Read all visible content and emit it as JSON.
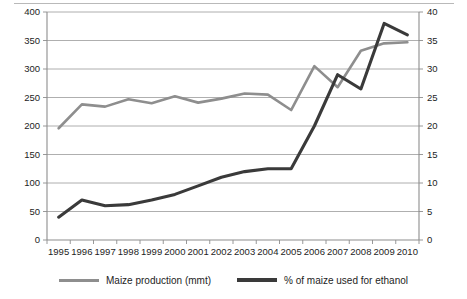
{
  "chart_data": {
    "type": "line",
    "title": "",
    "xlabel": "",
    "grid": true,
    "legend_position": "bottom",
    "x": [
      1995,
      1996,
      1997,
      1998,
      1999,
      2000,
      2001,
      2002,
      2003,
      2004,
      2005,
      2006,
      2007,
      2008,
      2009,
      2010
    ],
    "categories": [
      "1995",
      "1996",
      "1997",
      "1998",
      "1999",
      "2000",
      "2001",
      "2002",
      "2003",
      "2004",
      "2005",
      "2006",
      "2007",
      "2008",
      "2009",
      "2010"
    ],
    "axes": {
      "left": {
        "label": "Maize production (mmt)",
        "ylim": [
          0,
          400
        ],
        "ticks": [
          0,
          50,
          100,
          150,
          200,
          250,
          300,
          350,
          400
        ],
        "ticklabels": [
          "0",
          "50",
          "100",
          "150",
          "200",
          "250",
          "300",
          "350",
          "400"
        ]
      },
      "right": {
        "label": "% of maize used for ethanol",
        "ylim": [
          0,
          40
        ],
        "ticks": [
          0,
          5,
          10,
          15,
          20,
          25,
          30,
          35,
          40
        ],
        "ticklabels": [
          "0",
          "5",
          "10",
          "15",
          "20",
          "25",
          "30",
          "35",
          "40"
        ]
      }
    },
    "series": [
      {
        "name": "Maize production (mmt)",
        "axis": "left",
        "color": "#8e8e8e",
        "values": [
          196,
          238,
          234,
          247,
          240,
          252,
          241,
          248,
          257,
          255,
          228,
          305,
          268,
          332,
          345,
          347
        ]
      },
      {
        "name": "% of maize used for ethanol",
        "axis": "right",
        "color": "#3a3a3a",
        "values": [
          4.0,
          7.0,
          6.0,
          6.2,
          7.0,
          8.0,
          9.5,
          11.0,
          12.0,
          12.5,
          12.5,
          20.0,
          29.0,
          26.5,
          38.0,
          36.0
        ]
      }
    ]
  },
  "legend": {
    "items": [
      {
        "label": "Maize production (mmt)",
        "color": "#8e8e8e"
      },
      {
        "label": "% of maize used for ethanol",
        "color": "#3a3a3a"
      }
    ]
  }
}
